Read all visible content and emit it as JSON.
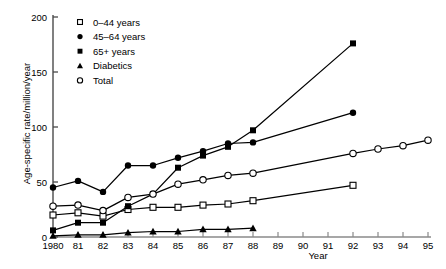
{
  "chart_data": {
    "type": "line",
    "title": "",
    "xlabel": "Year",
    "ylabel": "Age-specific rate/million/year",
    "xlim": [
      1980,
      1995
    ],
    "ylim": [
      0,
      200
    ],
    "ytick_labels": [
      "0",
      "50",
      "100",
      "150",
      "200"
    ],
    "ytick_values": [
      0,
      50,
      100,
      150,
      200
    ],
    "xtick_labels": [
      "1980",
      "81",
      "82",
      "83",
      "84",
      "85",
      "86",
      "87",
      "88",
      "89",
      "90",
      "91",
      "92",
      "93",
      "94",
      "95"
    ],
    "xtick_values": [
      1980,
      1981,
      1982,
      1983,
      1984,
      1985,
      1986,
      1987,
      1988,
      1989,
      1990,
      1991,
      1992,
      1993,
      1994,
      1995
    ],
    "grid": false,
    "legend_position": "top-left-inside",
    "series": [
      {
        "name": "0–44 years",
        "marker": "open-square",
        "x": [
          1980,
          1981,
          1982,
          1983,
          1984,
          1985,
          1986,
          1987,
          1988,
          1992
        ],
        "values": [
          20,
          22,
          19,
          25,
          27,
          27,
          29,
          30,
          33,
          47
        ]
      },
      {
        "name": "45–64 years",
        "marker": "filled-circle",
        "x": [
          1980,
          1981,
          1982,
          1983,
          1984,
          1985,
          1986,
          1987,
          1988,
          1992
        ],
        "values": [
          45,
          51,
          41,
          65,
          65,
          72,
          78,
          85,
          86,
          113
        ]
      },
      {
        "name": "65+ years",
        "marker": "filled-square",
        "x": [
          1980,
          1981,
          1982,
          1983,
          1984,
          1985,
          1986,
          1987,
          1988,
          1992
        ],
        "values": [
          6,
          13,
          13,
          28,
          39,
          63,
          74,
          82,
          97,
          176
        ]
      },
      {
        "name": "Diabetics",
        "marker": "filled-triangle",
        "x": [
          1980,
          1981,
          1982,
          1983,
          1984,
          1985,
          1986,
          1987,
          1988
        ],
        "values": [
          1,
          2,
          2,
          4,
          5,
          5,
          7,
          7,
          8
        ]
      },
      {
        "name": "Total",
        "marker": "open-circle",
        "x": [
          1980,
          1981,
          1982,
          1983,
          1984,
          1985,
          1986,
          1987,
          1988,
          1992,
          1993,
          1994,
          1995
        ],
        "values": [
          28,
          29,
          24,
          36,
          39,
          48,
          52,
          56,
          58,
          76,
          80,
          83,
          88
        ]
      }
    ]
  },
  "legend": {
    "items": [
      {
        "label": "0–44 years",
        "marker": "open-square"
      },
      {
        "label": "45–64 years",
        "marker": "filled-circle"
      },
      {
        "label": "65+ years",
        "marker": "filled-square"
      },
      {
        "label": "Diabetics",
        "marker": "filled-triangle"
      },
      {
        "label": "Total",
        "marker": "open-circle"
      }
    ]
  },
  "axes": {
    "x_title": "Year",
    "y_title": "Age-specific rate/million/year"
  },
  "colors": {
    "line": "#000000",
    "marker_fill": "#000000",
    "marker_open_fill": "#ffffff",
    "axis": "#000000",
    "background": "#ffffff"
  }
}
